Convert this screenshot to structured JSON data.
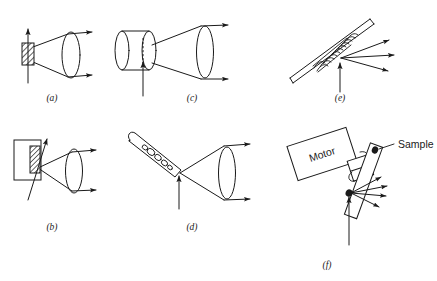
{
  "figure": {
    "background_color": "#ffffff",
    "line_color": "#1a1a1a",
    "width": 437,
    "height": 281
  },
  "panels": [
    {
      "id": "a",
      "label": "(a)",
      "label_x": 52,
      "label_y": 101,
      "description": "Flat hatched solid sample in transmission, beam transmitted through sample into collection lens",
      "elements": [
        "hatched-sample-block",
        "vertical-excitation-arrow",
        "collection-cone",
        "collection-lens",
        "output-ray-upper",
        "output-ray-lower"
      ]
    },
    {
      "id": "b",
      "label": "(b)",
      "label_x": 52,
      "label_y": 230,
      "description": "Hatched sample mounted on a holder block, oblique excitation arrow, collection cone into lens",
      "elements": [
        "holder-rectangle",
        "hatched-sample-block",
        "oblique-excitation-arrow",
        "collection-cone",
        "collection-lens",
        "output-ray-upper",
        "output-ray-lower"
      ]
    },
    {
      "id": "c",
      "label": "(c)",
      "label_x": 192,
      "label_y": 101,
      "description": "Cylindrical cell or ampoule with internal dashed beam path, excitation arrow entering from below, collection cone into lens",
      "elements": [
        "cylinder-body",
        "cylinder-front-ellipse",
        "cylinder-back-ellipse",
        "internal-dashed-beam",
        "vertical-excitation-arrow",
        "collection-cone",
        "collection-lens",
        "output-ray-upper",
        "output-ray-lower"
      ]
    },
    {
      "id": "d",
      "label": "(d)",
      "label_x": 192,
      "label_y": 230,
      "description": "Tilted capillary tube containing particles, excitation arrow entering at the tip, collection cone into lens",
      "elements": [
        "capillary-tube",
        "particle-cluster",
        "vertical-excitation-arrow",
        "collection-cone",
        "collection-lens",
        "output-ray-upper",
        "output-ray-lower"
      ]
    },
    {
      "id": "e",
      "label": "(e)",
      "label_x": 340,
      "label_y": 101,
      "description": "Tilted rod with helical coil wound around it, vertical excitation arrow, three scattered output rays",
      "elements": [
        "tilted-rod",
        "helical-coil",
        "vertical-excitation-arrow",
        "scattered-ray-1",
        "scattered-ray-2",
        "scattered-ray-3"
      ]
    },
    {
      "id": "f",
      "label": "(f)",
      "label_x": 327,
      "label_y": 268,
      "description": "Motor driven rotating sample holder bar with samples, vertical excitation arrow, fan of scattered output rays",
      "elements": [
        "motor-box",
        "motor-shaft",
        "rotation-arrow",
        "sample-holder-bar",
        "sample-spot-upper",
        "sample-spot-lower",
        "sample-leader-line",
        "vertical-excitation-arrow",
        "scattered-ray-1",
        "scattered-ray-2",
        "scattered-ray-3",
        "scattered-ray-4"
      ],
      "text_labels": [
        {
          "name": "motor-label",
          "text": "Motor",
          "x": 323,
          "y": 158
        },
        {
          "name": "sample-label",
          "text": "Sample",
          "x": 400,
          "y": 156
        }
      ]
    }
  ],
  "labels": {
    "panel_a": "(a)",
    "panel_b": "(b)",
    "panel_c": "(c)",
    "panel_d": "(d)",
    "panel_e": "(e)",
    "panel_f": "(f)",
    "motor": "Motor",
    "sample": "Sample"
  }
}
